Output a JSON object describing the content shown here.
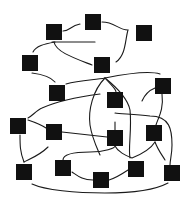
{
  "diagram": {
    "type": "graph",
    "background": "#ffffff",
    "node_color": "#111111",
    "edge_color": "#1a1a1a",
    "node_size": 16,
    "nodes": [
      {
        "id": "n1",
        "x": 46,
        "y": 24
      },
      {
        "id": "n2",
        "x": 85,
        "y": 14
      },
      {
        "id": "n3",
        "x": 136,
        "y": 25
      },
      {
        "id": "n4",
        "x": 22,
        "y": 55
      },
      {
        "id": "n5",
        "x": 94,
        "y": 57
      },
      {
        "id": "n6",
        "x": 155,
        "y": 78
      },
      {
        "id": "n7",
        "x": 49,
        "y": 85
      },
      {
        "id": "n8",
        "x": 107,
        "y": 92
      },
      {
        "id": "n9",
        "x": 10,
        "y": 118
      },
      {
        "id": "n10",
        "x": 46,
        "y": 124
      },
      {
        "id": "n11",
        "x": 107,
        "y": 130
      },
      {
        "id": "n12",
        "x": 146,
        "y": 125
      },
      {
        "id": "n13",
        "x": 16,
        "y": 164
      },
      {
        "id": "n14",
        "x": 55,
        "y": 160
      },
      {
        "id": "n15",
        "x": 93,
        "y": 172
      },
      {
        "id": "n16",
        "x": 128,
        "y": 161
      },
      {
        "id": "n17",
        "x": 164,
        "y": 165
      }
    ],
    "edges": [
      {
        "d": "M63,31 C70,31 70,26 80,24"
      },
      {
        "d": "M102,22 C115,22 118,30 128,30 C125,40 126,55 116,62"
      },
      {
        "d": "M52,42 L95,42"
      },
      {
        "d": "M55,42 C44,44 36,46 33,52"
      },
      {
        "d": "M54,42 C56,52 74,58 92,65"
      },
      {
        "d": "M32,73 C40,74 50,76 55,82"
      },
      {
        "d": "M66,84 C80,80 95,80 105,78 C125,74 148,70 160,74"
      },
      {
        "d": "M105,78 C93,90 88,110 90,125 C92,138 97,148 100,155"
      },
      {
        "d": "M105,78 C112,86 116,89 116,92"
      },
      {
        "d": "M105,78 C120,90 128,100 130,110 C132,130 128,148 130,158"
      },
      {
        "d": "M142,101 C145,94 150,90 155,88"
      },
      {
        "d": "M162,94 C164,110 158,118 156,125"
      },
      {
        "d": "M28,118 C32,116 37,110 42,108 C60,100 85,96 100,94"
      },
      {
        "d": "M28,120 C34,122 40,124 46,128"
      },
      {
        "d": "M62,132 L107,137"
      },
      {
        "d": "M115,122 C115,125 115,128 115,130"
      },
      {
        "d": "M115,113 C120,114 135,114 150,116 C170,116 172,130 172,145 C172,155 170,160 170,165"
      },
      {
        "d": "M20,135 C20,145 20,152 24,162"
      },
      {
        "d": "M24,162 C32,158 40,155 48,147"
      },
      {
        "d": "M63,160 C63,155 70,152 90,152 C105,152 115,148 115,146 C118,152 125,155 132,158 C142,154 150,150 155,142"
      },
      {
        "d": "M155,142 C158,150 162,155 165,160"
      },
      {
        "d": "M72,172 C78,176 82,180 93,180"
      },
      {
        "d": "M109,180 C116,178 122,174 128,170"
      },
      {
        "d": "M32,184 C45,190 75,193 105,193 C130,193 155,190 168,183"
      }
    ]
  }
}
